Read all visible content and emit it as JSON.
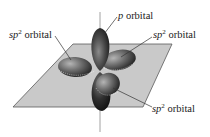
{
  "diagram": {
    "colors": {
      "plane_fill": "#c9c9c9",
      "plane_edge": "#5a5a5a",
      "lobe_dark": "#1e1e1e",
      "lobe_mid": "#6b6b6b",
      "lobe_light": "#a8a8a8",
      "axis": "#777777",
      "leader": "#333333"
    },
    "labels": [
      {
        "id": "p",
        "prefix": "p",
        "sup": "",
        "text": " orbital"
      },
      {
        "id": "sp2_left",
        "prefix": "sp",
        "sup": "2",
        "text": " orbital"
      },
      {
        "id": "sp2_right",
        "prefix": "sp",
        "sup": "2",
        "text": " orbital"
      },
      {
        "id": "sp2_bottom",
        "prefix": "sp",
        "sup": "2",
        "text": " orbital"
      }
    ]
  }
}
